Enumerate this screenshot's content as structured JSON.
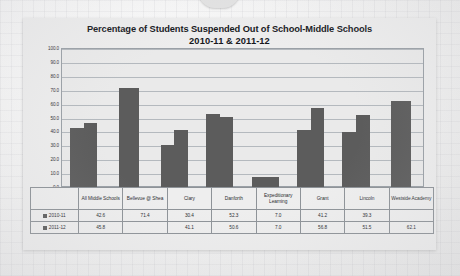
{
  "chart_data": {
    "type": "bar",
    "title": "Percentage of Students Suspended Out of School-Middle Schools",
    "subtitle": "2010-11 & 2011-12",
    "xlabel": "",
    "ylabel": "",
    "ylim": [
      0,
      100
    ],
    "ytick_labels": [
      "100.0",
      "90.0",
      "80.0",
      "70.0",
      "60.0",
      "50.0",
      "40.0",
      "30.0",
      "20.0",
      "10.0",
      "0.0"
    ],
    "ytick_values": [
      100,
      90,
      80,
      70,
      60,
      50,
      40,
      30,
      20,
      10,
      0
    ],
    "grid": true,
    "legend_position": "table-left",
    "bar_color": "#5c5c5c",
    "categories": [
      "All Middle Schools",
      "Bellevue @ Shea",
      "Clary",
      "Danforth",
      "Expeditionary Learning",
      "Grant",
      "Lincoln",
      "Westside Academy"
    ],
    "series": [
      {
        "name": "2010-11",
        "values": [
          42.6,
          71.4,
          30.4,
          52.3,
          7.0,
          41.2,
          39.3,
          null
        ],
        "labels": [
          "42.6",
          "71.4",
          "30.4",
          "52.3",
          "7.0",
          "41.2",
          "39.3",
          ""
        ]
      },
      {
        "name": "2011-12",
        "values": [
          45.8,
          null,
          41.1,
          50.6,
          7.0,
          56.8,
          51.5,
          62.1
        ],
        "labels": [
          "45.8",
          "",
          "41.1",
          "50.6",
          "7.0",
          "56.8",
          "51.5",
          "62.1"
        ]
      }
    ]
  }
}
